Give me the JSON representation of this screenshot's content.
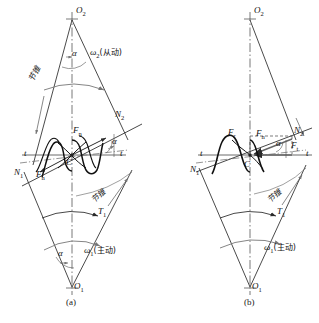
{
  "figure": {
    "title_caption_a": "(a)",
    "title_caption_b": "(b)"
  },
  "panel_a": {
    "caption": "(a)",
    "apex_top": "O",
    "apex_top_sub": "2",
    "apex_bottom": "O",
    "apex_bottom_sub": "1",
    "pitch_point": "C",
    "normal_upper": "N",
    "normal_upper_sub": "2",
    "normal_lower": "N",
    "normal_lower_sub": "1",
    "tangent_left": "t",
    "tangent_right": "t",
    "force_normal_upper": "F",
    "force_normal_upper_sub": "n",
    "force_normal_lower": "F",
    "force_normal_lower_sub": "n",
    "torque": "T",
    "torque_sub": "1",
    "angle_top": "α",
    "angle_mid": "α",
    "angle_bottom": "α",
    "omega_driven": "ω",
    "omega_driven_sub": "2",
    "omega_driven_note": "(从动)",
    "omega_driving": "ω",
    "omega_driving_sub": "1",
    "omega_driving_note": "(主动)",
    "cone_label_upper": "节锥",
    "cone_label_lower": "节锥"
  },
  "panel_b": {
    "caption": "(b)",
    "apex_top": "O",
    "apex_top_sub": "2",
    "apex_bottom": "O",
    "apex_bottom_sub": "1",
    "pitch_point": "C",
    "normal_upper": "N",
    "normal_upper_sub": "2",
    "normal_lower": "N",
    "normal_lower_sub": "1",
    "tangent_left": "t",
    "tangent_right": "t",
    "force_radial": "F",
    "force_radial_sub": "r",
    "force_normal": "F",
    "force_normal_sub": "n",
    "force_tangential": "F",
    "force_tangential_sub": "t",
    "torque": "T",
    "torque_sub": "1",
    "angle_mid": "α",
    "omega_driving": "ω",
    "omega_driving_sub": "1",
    "omega_driving_note": "(主动)",
    "cone_label": "节锥"
  },
  "colors": {
    "line": "#2b2b2b",
    "thin": "#444444",
    "grey": "#888888",
    "background": "#ffffff"
  }
}
